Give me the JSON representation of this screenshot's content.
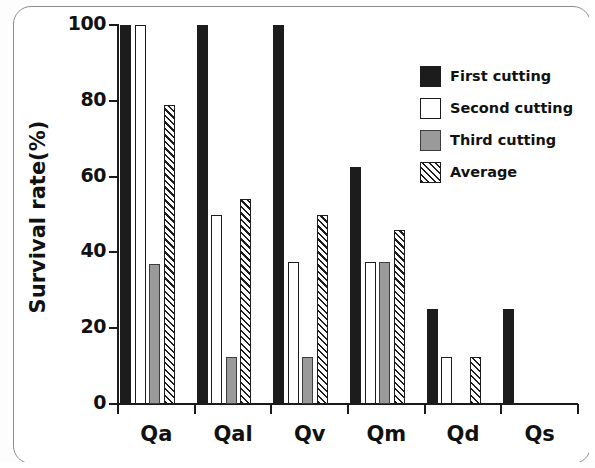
{
  "chart_data": {
    "type": "bar",
    "title": "",
    "xlabel": "",
    "ylabel": "Survival rate(%)",
    "ylim": [
      0,
      100
    ],
    "yticks": [
      0,
      20,
      40,
      60,
      80,
      100
    ],
    "ytick_labels": [
      "0",
      "20",
      "40",
      "60",
      "80",
      "100"
    ],
    "grid": false,
    "legend_position": "top-right",
    "categories": [
      "Qa",
      "Qal",
      "Qv",
      "Qm",
      "Qd",
      "Qs"
    ],
    "series": [
      {
        "name": "First cutting",
        "fill": "solid-black",
        "color": "#1c1c1c",
        "values": [
          100,
          100,
          100,
          62.5,
          25,
          25
        ]
      },
      {
        "name": "Second cutting",
        "fill": "white",
        "color": "#ffffff",
        "values": [
          100,
          50,
          37.5,
          37.5,
          12.5,
          0
        ]
      },
      {
        "name": "Third cutting",
        "fill": "gray",
        "color": "#9a9a9a",
        "values": [
          37,
          12.5,
          12.5,
          37.5,
          0,
          0
        ]
      },
      {
        "name": "Average",
        "fill": "diagonal-hatch",
        "color": "#1c1c1c",
        "values": [
          79,
          54,
          50,
          46,
          12.5,
          0
        ]
      }
    ]
  },
  "legend": {
    "entries": [
      {
        "label": "First cutting"
      },
      {
        "label": "Second cutting"
      },
      {
        "label": "Third cutting"
      },
      {
        "label": "Average"
      }
    ]
  }
}
